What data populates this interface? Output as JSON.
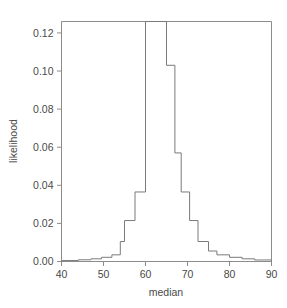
{
  "chart_data": {
    "type": "line",
    "subtype": "step-histogram",
    "title": "",
    "xlabel": "median",
    "ylabel": "likelihood",
    "xlim": [
      40,
      90
    ],
    "ylim": [
      0.0,
      0.126
    ],
    "grid": false,
    "legend": null,
    "xticks": [
      40,
      50,
      60,
      70,
      80,
      90
    ],
    "xtick_labels": [
      "40",
      "50",
      "60",
      "70",
      "80",
      "90"
    ],
    "yticks": [
      0.0,
      0.02,
      0.04,
      0.06,
      0.08,
      0.1,
      0.12
    ],
    "ytick_labels": [
      "0.00",
      "0.02",
      "0.04",
      "0.06",
      "0.08",
      "0.10",
      "0.12"
    ],
    "bin_edges": [
      40.0,
      44.0,
      47.0,
      49.5,
      52.0,
      54.0,
      55.0,
      57.5,
      60.0,
      62.0,
      65.0,
      67.0,
      68.5,
      70.5,
      72.5,
      75.0,
      77.0,
      80.0,
      83.0,
      86.0,
      90.0
    ],
    "values": [
      0.0005,
      0.0009,
      0.0014,
      0.0022,
      0.0035,
      0.0105,
      0.0215,
      0.0365,
      0.126,
      0.126,
      0.103,
      0.057,
      0.0365,
      0.0215,
      0.0105,
      0.0055,
      0.0035,
      0.0022,
      0.0014,
      0.0008
    ],
    "series_name": "likelihood",
    "line_color": "#7a7a7a",
    "axis_color": "#8c8c8c",
    "text_color": "#4a4a4a",
    "background": "#ffffff",
    "peak_value": 0.126,
    "peak_range": [
      60,
      65
    ]
  },
  "figure": {
    "axis_title_x": "median",
    "axis_title_y": "likelihood"
  }
}
